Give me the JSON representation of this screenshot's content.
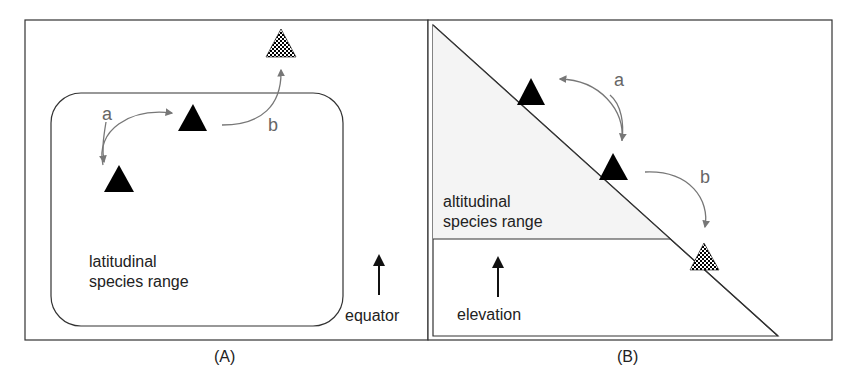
{
  "panels": [
    {
      "caption": "(A)",
      "range_label_line1": "latitudinal",
      "range_label_line2": "species range",
      "direction_label": "equator",
      "arrow_a_label": "a",
      "arrow_b_label": "b"
    },
    {
      "caption": "(B)",
      "range_label_line1": "altitudinal",
      "range_label_line2": "species range",
      "direction_label": "elevation",
      "arrow_a_label": "a",
      "arrow_b_label": "b"
    }
  ],
  "colors": {
    "border": "#333333",
    "arrow_gray": "#777777",
    "shade": "#f4f4f4",
    "triangle": "#000000"
  }
}
